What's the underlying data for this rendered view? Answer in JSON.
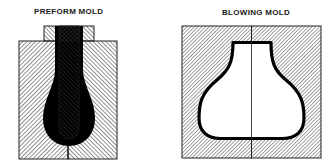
{
  "diagram": {
    "panels": [
      {
        "id": "preform",
        "title": "PREFORM MOLD",
        "parts": [
          "mold-body-left-half",
          "mold-body-right-half",
          "neck-ring-cap",
          "core-rod",
          "preform-cavity"
        ]
      },
      {
        "id": "blowing",
        "title": "BLOWING MOLD",
        "parts": [
          "mold-body-left-half",
          "mold-body-right-half",
          "bottle-cavity",
          "parting-line"
        ]
      }
    ],
    "colors": {
      "hatch_line": "#333333",
      "outline": "#222222",
      "plastic_fill": "#000000",
      "background": "#ffffff"
    }
  }
}
